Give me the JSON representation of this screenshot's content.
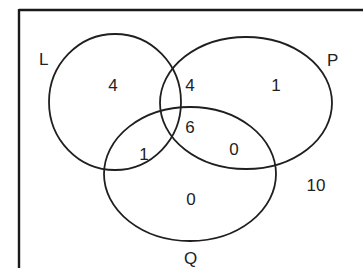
{
  "diagram": {
    "type": "venn",
    "sets": [
      {
        "id": "L",
        "label": "L"
      },
      {
        "id": "P",
        "label": "P"
      },
      {
        "id": "Q",
        "label": "Q"
      }
    ],
    "regions": {
      "L_only": "4",
      "L_and_P_only": "4",
      "P_only": "1",
      "L_and_Q_only": "1",
      "L_P_Q": "6",
      "P_and_Q_only": "0",
      "Q_only": "0",
      "outside": "10"
    },
    "colors": {
      "stroke": "#1f1f1f",
      "background": "#ffffff"
    }
  }
}
